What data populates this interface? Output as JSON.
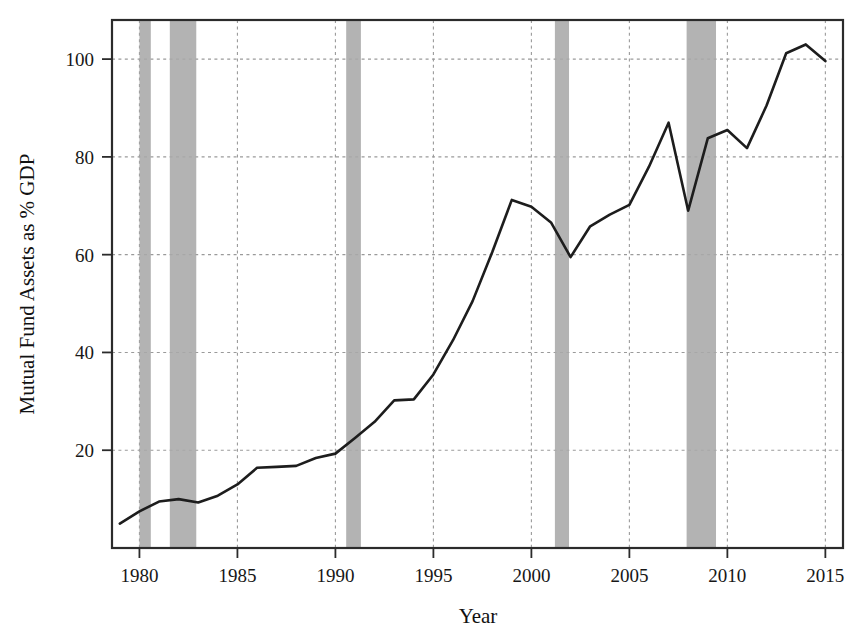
{
  "chart_data": {
    "type": "line",
    "title": "",
    "subtitle": "",
    "xlabel": "Year",
    "ylabel": "Mutual Fund Assets as % GDP",
    "xlim": [
      1978.6,
      2015.9
    ],
    "ylim": [
      0,
      108
    ],
    "xticks": [
      1980,
      1985,
      1990,
      1995,
      2000,
      2005,
      2010,
      2015
    ],
    "xtick_labels": [
      "1980",
      "1985",
      "1990",
      "1995",
      "2000",
      "2005",
      "2010",
      "2015"
    ],
    "yticks": [
      20,
      40,
      60,
      80,
      100
    ],
    "ytick_labels": [
      "20",
      "40",
      "60",
      "80",
      "100"
    ],
    "grid": true,
    "grid_style": "dotted",
    "legend": null,
    "legend_position": "none",
    "line_color": "#1d1d1d",
    "band_color": "#a8a8a8",
    "series": [
      {
        "name": "Mutual Fund Assets as % GDP",
        "x": [
          1979,
          1980,
          1981,
          1982,
          1983,
          1984,
          1985,
          1986,
          1987,
          1988,
          1989,
          1990,
          1991,
          1992,
          1993,
          1994,
          1995,
          1996,
          1997,
          1998,
          1999,
          2000,
          2001,
          2002,
          2003,
          2004,
          2005,
          2006,
          2007,
          2008,
          2009,
          2010,
          2011,
          2012,
          2013,
          2014,
          2015
        ],
        "values": [
          5.0,
          7.5,
          9.5,
          10.0,
          9.3,
          10.7,
          13.0,
          16.4,
          16.6,
          16.8,
          18.4,
          19.3,
          22.5,
          25.8,
          30.2,
          30.4,
          35.5,
          42.5,
          50.5,
          60.5,
          71.2,
          69.8,
          66.6,
          59.5,
          65.8,
          68.2,
          70.2,
          78.0,
          87.0,
          69.0,
          83.8,
          85.5,
          81.8,
          90.5,
          101.2,
          103.0,
          99.6
        ]
      }
    ],
    "annotations": {
      "recession_bands": [
        {
          "start": 1980.0,
          "end": 1980.58
        },
        {
          "start": 1981.55,
          "end": 1982.9
        },
        {
          "start": 1990.55,
          "end": 1991.3
        },
        {
          "start": 2001.2,
          "end": 2001.92
        },
        {
          "start": 2007.92,
          "end": 2009.42
        }
      ],
      "recession_band_note": "shaded vertical bands mark NBER recessions"
    }
  }
}
